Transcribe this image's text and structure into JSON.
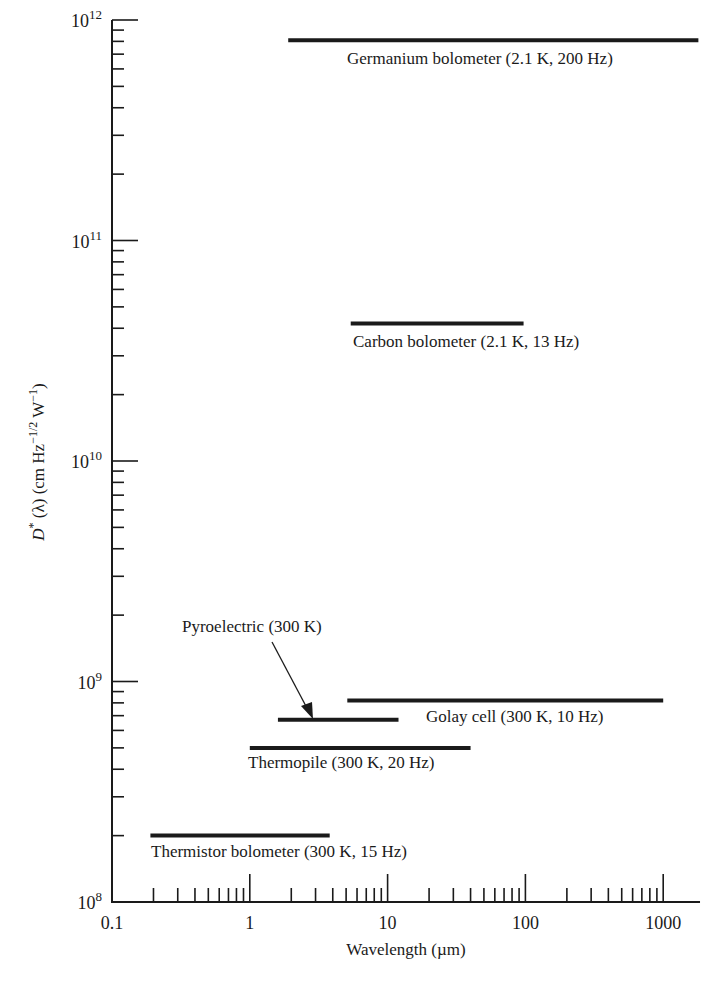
{
  "chart_data": {
    "type": "range-bar",
    "title": "",
    "xlabel": "Wavelength (µm)",
    "ylabel": "D* (λ) (cm Hz^-1/2 W^-1)",
    "xscale": "log",
    "yscale": "log",
    "xlim": [
      0.1,
      1850
    ],
    "ylim": [
      100000000.0,
      1000000000000.0
    ],
    "x_ticks": [
      0.1,
      1,
      10,
      100,
      1000
    ],
    "x_tick_labels": [
      "0.1",
      "1",
      "10",
      "100",
      "1000"
    ],
    "y_ticks": [
      100000000.0,
      1000000000.0,
      10000000000.0,
      100000000000.0,
      1000000000000.0
    ],
    "y_tick_labels": [
      {
        "base": "10",
        "exp": "8"
      },
      {
        "base": "10",
        "exp": "9"
      },
      {
        "base": "10",
        "exp": "10"
      },
      {
        "base": "10",
        "exp": "11"
      },
      {
        "base": "10",
        "exp": "12"
      }
    ],
    "grid": false,
    "legend": "none (inline labels)",
    "series": [
      {
        "name": "Germanium bolometer (2.1 K, 200 Hz)",
        "x_start": 1.9,
        "x_end": 1800,
        "value": 810000000000.0
      },
      {
        "name": "Carbon bolometer (2.1 K, 13 Hz)",
        "x_start": 5.4,
        "x_end": 97,
        "value": 42000000000.0
      },
      {
        "name": "Golay cell (300 K, 10 Hz)",
        "x_start": 5.1,
        "x_end": 1000,
        "value": 820000000.0
      },
      {
        "name": "Pyroelectric (300 K)",
        "x_start": 1.6,
        "x_end": 12,
        "value": 670000000.0
      },
      {
        "name": "Thermopile (300 K, 20 Hz)",
        "x_start": 1.0,
        "x_end": 40,
        "value": 500000000.0
      },
      {
        "name": "Thermistor bolometer (300 K, 15 Hz)",
        "x_start": 0.19,
        "x_end": 3.8,
        "value": 200000000.0
      }
    ],
    "annotations": [
      {
        "text": "Pyroelectric (300 K)",
        "type": "arrow",
        "points_to": "Pyroelectric bar"
      }
    ]
  },
  "labels": {
    "germanium": "Germanium bolometer (2.1 K, 200 Hz)",
    "carbon": "Carbon bolometer (2.1 K, 13 Hz)",
    "golay": "Golay cell (300 K, 10 Hz)",
    "pyro": "Pyroelectric (300 K)",
    "thermopile": "Thermopile (300 K, 20 Hz)",
    "thermistor": "Thermistor bolometer (300 K, 15 Hz)"
  },
  "axes": {
    "xlabel": "Wavelength (µm)",
    "ylabel_prefix": "D",
    "ylabel_star": "*",
    "ylabel_mid": " (λ) (cm Hz",
    "ylabel_exp1": "−1/2",
    "ylabel_w": " W",
    "ylabel_exp2": "−1",
    "ylabel_end": ")"
  },
  "colors": {
    "ink": "#1a1a1a",
    "background": "#ffffff"
  }
}
